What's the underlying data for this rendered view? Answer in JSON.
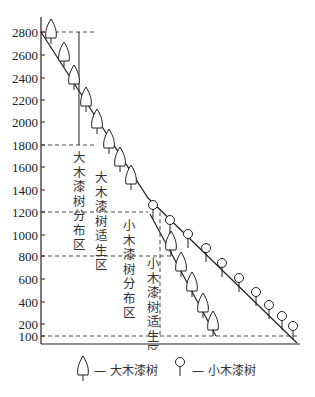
{
  "diagram": {
    "y_axis": {
      "ticks": [
        {
          "label": "2800",
          "y": 32
        },
        {
          "label": "2600",
          "y": 55
        },
        {
          "label": "2400",
          "y": 78
        },
        {
          "label": "2200",
          "y": 100
        },
        {
          "label": "2000",
          "y": 122
        },
        {
          "label": "1800",
          "y": 145
        },
        {
          "label": "1600",
          "y": 167
        },
        {
          "label": "1400",
          "y": 190
        },
        {
          "label": "1200",
          "y": 212
        },
        {
          "label": "1000",
          "y": 235
        },
        {
          "label": "800",
          "y": 256
        },
        {
          "label": "600",
          "y": 279
        },
        {
          "label": "400",
          "y": 302
        },
        {
          "label": "200",
          "y": 324
        },
        {
          "label": "100",
          "y": 336
        }
      ]
    },
    "zones": {
      "big_distribution": "大木漆树分布区",
      "big_suitable": "大木漆树适生区",
      "small_distribution": "小木漆树分布区",
      "small_suitable": "小木漆树适生区"
    },
    "zone_ranges": [
      {
        "name": "大木漆树分布区",
        "from": 1800,
        "to": 2800
      },
      {
        "name": "大木漆树适生区",
        "from": 800,
        "to": 2800
      },
      {
        "name": "小木漆树分布区",
        "from": 100,
        "to": 1200
      },
      {
        "name": "小木漆树适生区",
        "from": 100,
        "to": 800
      }
    ]
  },
  "legend": {
    "big_tree": "— 大木漆树",
    "small_tree": "— 小木漆树"
  }
}
